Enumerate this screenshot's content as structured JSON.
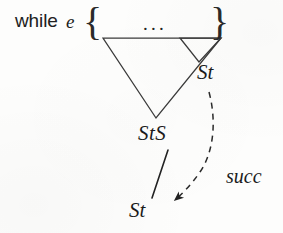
{
  "figure": {
    "width": 283,
    "height": 233,
    "background_color": "#fdfdfc",
    "ink_color": "#2a2a2a"
  },
  "code": {
    "keyword": "while",
    "condition": "e",
    "brace_open": "{",
    "brace_close": "}",
    "body_elision": "..."
  },
  "labels": {
    "st_inner": "St",
    "sts": "StS",
    "st_bottom": "St",
    "succ": "succ"
  },
  "shapes": {
    "big_triangle": {
      "name": "StS subtree triangle",
      "points": "103,38 221,38 156,118",
      "stroke": "#3a3a3a",
      "stroke_width": 1.25
    },
    "small_triangle": {
      "name": "St subtree triangle",
      "points": "180,38 221,38 199,62",
      "stroke": "#3a3a3a",
      "stroke_width": 1.25
    },
    "solid_edge": {
      "name": "StS to St derivation edge",
      "from_x": 168,
      "from_y": 150,
      "to_x": 152,
      "to_y": 198,
      "stroke": "#222222",
      "stroke_width": 1.6
    },
    "dashed_edge": {
      "name": "succ control-flow edge",
      "path": "M 209,92 C 216,118 215,150 200,172 C 190,186 181,195 173,201",
      "stroke": "#2a2a2a",
      "stroke_width": 1.5,
      "dash_pattern": "6 5",
      "arrowhead_tip_x": 170,
      "arrowhead_tip_y": 203
    }
  }
}
